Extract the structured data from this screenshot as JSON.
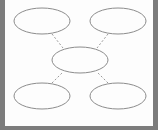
{
  "diagram": {
    "type": "hub-and-spoke",
    "colors": {
      "background": "#fdfdfd",
      "frame": "#7c7c7c",
      "shape_stroke": "#8c8c8c",
      "connector_stroke": "#9a9a9a"
    },
    "nodes": [
      {
        "id": "top-left",
        "label": "",
        "cx": 42,
        "cy": 21,
        "rx": 28,
        "ry": 13
      },
      {
        "id": "top-right",
        "label": "",
        "cx": 118,
        "cy": 21,
        "rx": 28,
        "ry": 13
      },
      {
        "id": "center",
        "label": "",
        "cx": 80,
        "cy": 60,
        "rx": 28,
        "ry": 13
      },
      {
        "id": "bottom-left",
        "label": "",
        "cx": 42,
        "cy": 96,
        "rx": 28,
        "ry": 13
      },
      {
        "id": "bottom-right",
        "label": "",
        "cx": 118,
        "cy": 96,
        "rx": 28,
        "ry": 13
      }
    ],
    "edges": [
      {
        "from": "top-left",
        "to": "center",
        "style": "dashed",
        "x1": 52,
        "y1": 34,
        "x2": 63,
        "y2": 48
      },
      {
        "from": "top-right",
        "to": "center",
        "style": "dashed",
        "x1": 108,
        "y1": 34,
        "x2": 97,
        "y2": 48
      },
      {
        "from": "bottom-left",
        "to": "center",
        "style": "dashed",
        "x1": 52,
        "y1": 83,
        "x2": 63,
        "y2": 72
      },
      {
        "from": "bottom-right",
        "to": "center",
        "style": "dashed",
        "x1": 108,
        "y1": 83,
        "x2": 97,
        "y2": 72
      }
    ]
  }
}
